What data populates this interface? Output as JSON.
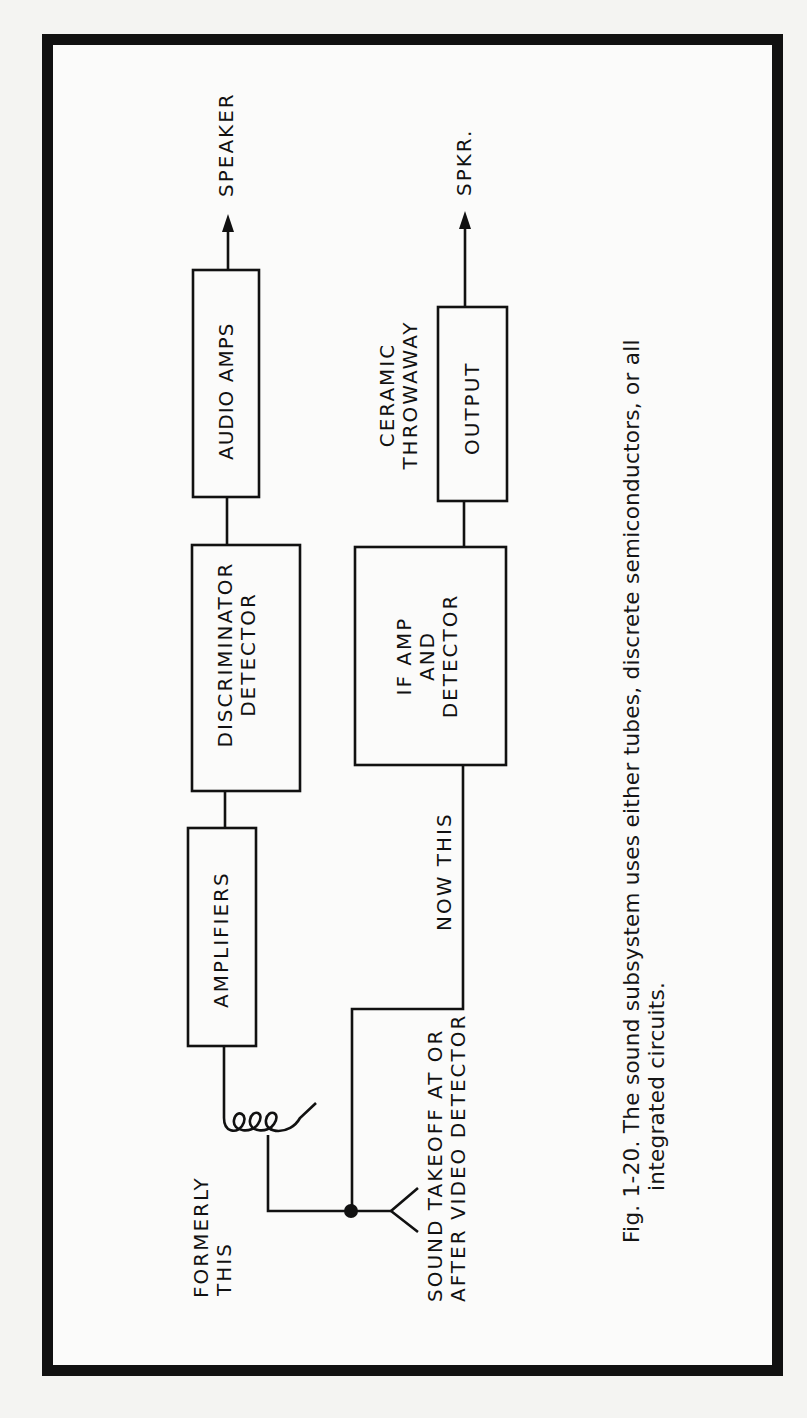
{
  "figure": {
    "caption_line1": "Fig. 1-20. The sound subsystem uses either tubes, discrete semiconductors, or all",
    "caption_line2": "integrated circuits."
  },
  "upper_chain": {
    "blocks": [
      {
        "id": "amplifiers",
        "label": "AMPLIFIERS"
      },
      {
        "id": "discriminator",
        "label_line1": "DISCRIMINATOR",
        "label_line2": "DETECTOR"
      },
      {
        "id": "audio-amps",
        "label": "AUDIO AMPS"
      }
    ],
    "output_label": "SPEAKER",
    "input_label_line1": "FORMERLY",
    "input_label_line2": "THIS"
  },
  "lower_chain": {
    "blocks": [
      {
        "id": "if-amp",
        "label_line1": "IF AMP",
        "label_line2": "AND",
        "label_line3": "DETECTOR"
      },
      {
        "id": "output",
        "label": "OUTPUT"
      }
    ],
    "output_note_line1": "CERAMIC",
    "output_note_line2": "THROWAWAY",
    "output_label": "SPKR.",
    "input_label": "NOW THIS"
  },
  "source": {
    "label_line1": "SOUND TAKEOFF AT OR",
    "label_line2": "AFTER VIDEO DETECTOR"
  },
  "colors": {
    "ink": "#111111",
    "paper": "#f4f4f2"
  }
}
